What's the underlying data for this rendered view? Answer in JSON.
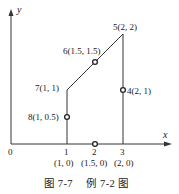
{
  "axes": {
    "x_label": "x",
    "y_label": "y",
    "origin_label": "0",
    "x_ticks": [
      "1",
      "2",
      "3"
    ]
  },
  "points": [
    {
      "id": "5",
      "label": "5(2, 2)",
      "x": 2,
      "y": 2,
      "marker": "vertex"
    },
    {
      "id": "6",
      "label": "6(1.5, 1.5)",
      "x": 1.5,
      "y": 1.5,
      "marker": "circle"
    },
    {
      "id": "7",
      "label": "7(1, 1)",
      "x": 1,
      "y": 1,
      "marker": "vertex"
    },
    {
      "id": "8",
      "label": "8(1, 0.5)",
      "x": 1,
      "y": 0.5,
      "marker": "circle"
    },
    {
      "id": "4",
      "label": "4(2, 1)",
      "x": 2,
      "y": 1,
      "marker": "circle"
    }
  ],
  "bottom_labels": [
    "(1, 0)",
    "(1.5, 0)",
    "(2, 0)"
  ],
  "caption": {
    "figure": "图 7-7",
    "title": "例 7-2 图"
  }
}
